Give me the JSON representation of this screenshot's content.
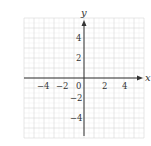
{
  "diagram": {
    "type": "coordinate-plane",
    "x_axis": {
      "label": "x",
      "min": -6,
      "max": 6,
      "tick_labels": [
        "-4",
        "-2",
        "0",
        "2",
        "4"
      ],
      "tick_values": [
        -4,
        -2,
        0,
        2,
        4
      ]
    },
    "y_axis": {
      "label": "y",
      "min": -6,
      "max": 6,
      "tick_labels": [
        "4",
        "2",
        "-2",
        "-4"
      ],
      "tick_values": [
        4,
        2,
        -2,
        -4
      ]
    },
    "grid": {
      "step": 1,
      "minor_step": 0.5,
      "visible": true
    },
    "colors": {
      "grid": "#d8d8d8",
      "minor_grid": "#eeeeee",
      "axis": "#333333",
      "text": "#333333"
    }
  },
  "labels": {
    "x": "x",
    "y": "y",
    "xt_m4": "−4",
    "xt_m2": "−2",
    "xt_0": "0",
    "xt_2": "2",
    "xt_4": "4",
    "yt_4": "4",
    "yt_2": "2",
    "yt_m2": "−2",
    "yt_m4": "−4"
  }
}
